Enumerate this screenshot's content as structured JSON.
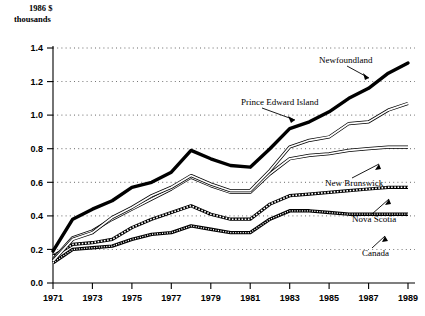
{
  "chart_data": {
    "type": "line",
    "title": "",
    "axis_note_line1": "1986 $",
    "axis_note_line2": "thousands",
    "xlabel": "",
    "ylabel": "1986 $ thousands",
    "xlim": [
      1971,
      1989
    ],
    "ylim": [
      0.0,
      1.4
    ],
    "grid": true,
    "gridlines_y": [
      0.2,
      0.4,
      0.6,
      0.8,
      1.0,
      1.2,
      1.4
    ],
    "ytick_labels": [
      "0.0",
      "0.2",
      "0.4",
      "0.6",
      "0.8",
      "1.0",
      "1.2",
      "1.4"
    ],
    "ytick_values": [
      0.0,
      0.2,
      0.4,
      0.6,
      0.8,
      1.0,
      1.2,
      1.4
    ],
    "xtick_labels": [
      "1971",
      "1973",
      "1975",
      "1977",
      "1979",
      "1981",
      "1983",
      "1985",
      "1987",
      "1989"
    ],
    "xtick_values": [
      1971,
      1973,
      1975,
      1977,
      1979,
      1981,
      1983,
      1985,
      1987,
      1989
    ],
    "x": [
      1971,
      1972,
      1973,
      1974,
      1975,
      1976,
      1977,
      1978,
      1979,
      1980,
      1981,
      1982,
      1983,
      1984,
      1985,
      1986,
      1987,
      1988,
      1989
    ],
    "legend_position": "inline-annotations",
    "series": [
      {
        "name": "Newfoundland",
        "style": "bold-solid",
        "values": [
          0.19,
          0.38,
          0.44,
          0.49,
          0.57,
          0.6,
          0.66,
          0.79,
          0.74,
          0.7,
          0.69,
          0.8,
          0.92,
          0.96,
          1.02,
          1.1,
          1.16,
          1.25,
          1.31
        ]
      },
      {
        "name": "Prince Edward Island",
        "style": "outline",
        "values": [
          0.13,
          0.26,
          0.3,
          0.39,
          0.45,
          0.52,
          0.57,
          0.64,
          0.59,
          0.55,
          0.55,
          0.67,
          0.81,
          0.85,
          0.87,
          0.95,
          0.96,
          1.03,
          1.07
        ]
      },
      {
        "name": "New Brunswick",
        "style": "outline",
        "values": [
          0.14,
          0.27,
          0.31,
          0.38,
          0.44,
          0.5,
          0.56,
          0.63,
          0.58,
          0.54,
          0.54,
          0.65,
          0.74,
          0.76,
          0.77,
          0.79,
          0.8,
          0.81,
          0.81
        ]
      },
      {
        "name": "Nova Scotia",
        "style": "hatched",
        "values": [
          0.16,
          0.23,
          0.24,
          0.26,
          0.33,
          0.38,
          0.42,
          0.46,
          0.41,
          0.38,
          0.38,
          0.47,
          0.52,
          0.53,
          0.54,
          0.55,
          0.56,
          0.57,
          0.57
        ]
      },
      {
        "name": "Canada",
        "style": "dense-hatched",
        "values": [
          0.12,
          0.2,
          0.21,
          0.22,
          0.26,
          0.29,
          0.3,
          0.34,
          0.32,
          0.3,
          0.3,
          0.38,
          0.43,
          0.43,
          0.42,
          0.41,
          0.41,
          0.41,
          0.41
        ]
      }
    ],
    "annotations": [
      {
        "label": "Newfoundland",
        "target_series": "Newfoundland",
        "target_x": 1987
      },
      {
        "label": "Prince Edward Island",
        "target_series": "Prince Edward Island",
        "target_x": 1983
      },
      {
        "label": "New Brunswick",
        "target_series": "New Brunswick",
        "target_x": 1987
      },
      {
        "label": "Nova Scotia",
        "target_series": "Nova Scotia",
        "target_x": 1988
      },
      {
        "label": "Canada",
        "target_series": "Canada",
        "target_x": 1988
      }
    ]
  },
  "labels": {
    "note1": "1986 $",
    "note2": "thousands",
    "y0": "0.0",
    "y2": "0.2",
    "y4": "0.4",
    "y6": "0.6",
    "y8": "0.8",
    "y10": "1.0",
    "y12": "1.2",
    "y14": "1.4",
    "x1971": "1971",
    "x1973": "1973",
    "x1975": "1975",
    "x1977": "1977",
    "x1979": "1979",
    "x1981": "1981",
    "x1983": "1983",
    "x1985": "1985",
    "x1987": "1987",
    "x1989": "1989",
    "nfld": "Newfoundland",
    "pei": "Prince Edward Island",
    "nb": "New Brunswick",
    "ns": "Nova Scotia",
    "can": "Canada"
  }
}
